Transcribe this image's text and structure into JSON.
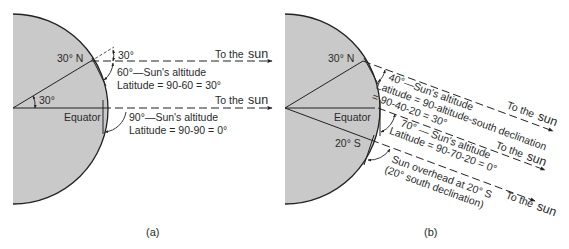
{
  "colors": {
    "earth_fill": "#c9c9c9",
    "line": "#222222",
    "background": "#ffffff"
  },
  "panel_a": {
    "caption": "(a)",
    "labels": {
      "lat_north": "30° N",
      "equator": "Equator",
      "center_angle": "30°",
      "zenith_angle": "30°",
      "to_the": "To the",
      "sun": "sun"
    },
    "ray_north": {
      "altitude_text": "60°—Sun's altitude",
      "latitude_text": "Latitude = 90-60 = 30°"
    },
    "ray_equator": {
      "altitude_text": "90°—Sun's altitude",
      "latitude_text": "Latitude = 90-90 = 0°"
    }
  },
  "panel_b": {
    "caption": "(b)",
    "labels": {
      "lat_north": "30° N",
      "equator": "Equator",
      "lat_south": "20° S",
      "to_the": "To the",
      "sun": "sun"
    },
    "ray_north": {
      "altitude_text": "40°—Sun's altitude",
      "latitude_text_1": "Latitude = 90-altitude-south declination",
      "latitude_text_2": "= 90-40-20 = 30°"
    },
    "ray_equator": {
      "altitude_text": "70° — Sun's altitude",
      "latitude_text": "Latitude = 90-70-20 = 0°"
    },
    "ray_south": {
      "line_1": "Sun overhead at 20° S",
      "line_2": "(20° south declination)"
    }
  }
}
